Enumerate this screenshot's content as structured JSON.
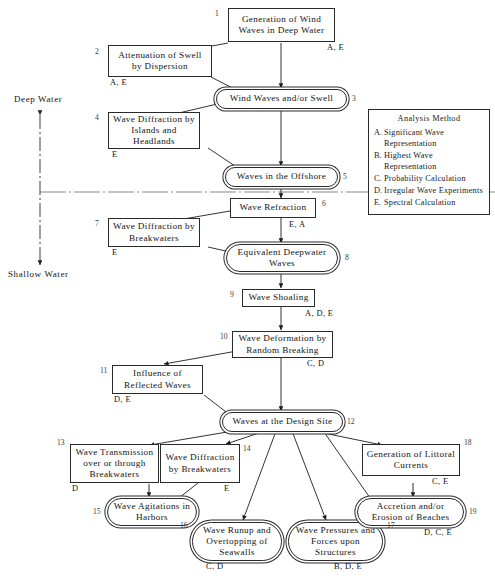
{
  "diagram": {
    "axis": {
      "deep_label": "Deep Water",
      "shallow_label": "Shallow Water"
    },
    "legend": {
      "title": "Analysis Method",
      "items": [
        {
          "key": "A.",
          "text": "Significant Wave Representation"
        },
        {
          "key": "B.",
          "text": "Highest Wave Representation"
        },
        {
          "key": "C.",
          "text": "Probability Calculation"
        },
        {
          "key": "D.",
          "text": "Irregular Wave Experiments"
        },
        {
          "key": "E.",
          "text": "Spectral Calculation"
        }
      ]
    },
    "nodes": [
      {
        "id": "1",
        "label": "Generation of Wind Waves in Deep Water",
        "shape": "rect",
        "methods": "A, E"
      },
      {
        "id": "2",
        "label": "Attenuation of Swell by Dispersion",
        "shape": "rect",
        "methods": "A, E"
      },
      {
        "id": "3",
        "label": "Wind Waves and/or Swell",
        "shape": "stadium",
        "methods": ""
      },
      {
        "id": "4",
        "label": "Wave Diffraction by Islands and Headlands",
        "shape": "rect",
        "methods": "E"
      },
      {
        "id": "5",
        "label": "Waves in the Offshore",
        "shape": "stadium",
        "methods": ""
      },
      {
        "id": "6",
        "label": "Wave Refraction",
        "shape": "rect",
        "methods": "E, A"
      },
      {
        "id": "7",
        "label": "Wave Diffraction by Breakwaters",
        "shape": "rect",
        "methods": "E"
      },
      {
        "id": "8",
        "label": "Equivalent Deepwater Waves",
        "shape": "stadium",
        "methods": ""
      },
      {
        "id": "9",
        "label": "Wave Shoaling",
        "shape": "rect",
        "methods": "A, D, E"
      },
      {
        "id": "10",
        "label": "Wave Deformation by Random Breaking",
        "shape": "rect",
        "methods": "C, D"
      },
      {
        "id": "11",
        "label": "Influence of Reflected Waves",
        "shape": "rect",
        "methods": "D, E"
      },
      {
        "id": "12",
        "label": "Waves at the Design Site",
        "shape": "stadium",
        "methods": ""
      },
      {
        "id": "13",
        "label": "Wave Transmission over or through Breakwaters",
        "shape": "rect",
        "methods": "D"
      },
      {
        "id": "14",
        "label": "Wave Diffraction by Breakwaters",
        "shape": "rect",
        "methods": "E"
      },
      {
        "id": "15",
        "label": "Wave Agitations in Harbors",
        "shape": "stadium",
        "methods": ""
      },
      {
        "id": "16",
        "label": "Wave Runup and Overtopping of Seawalls",
        "shape": "stadium",
        "methods": "C, D"
      },
      {
        "id": "17",
        "label": "Wave Pressures and Forces upon Structures",
        "shape": "stadium",
        "methods": "B, D, E"
      },
      {
        "id": "18",
        "label": "Generation of Littoral Currents",
        "shape": "rect",
        "methods": "C, E"
      },
      {
        "id": "19",
        "label": "Accretion and/or Erosion of Beaches",
        "shape": "stadium",
        "methods": "D, C, E"
      }
    ]
  }
}
